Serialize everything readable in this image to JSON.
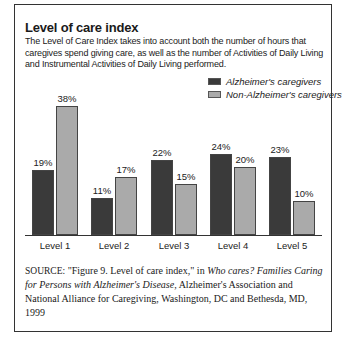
{
  "figure": {
    "title": "Level of care index",
    "subtitle": "The Level of Care Index takes into account both the number of hours that caregives spend giving care, as well as the number of Activities of Daily Living and Instrumental Activities of Daily Living performed.",
    "source_label": "SOURCE:",
    "source_part1": " \"Figure 9. Level of care index,\" in ",
    "source_italic": "Who cares? Families Caring for Persons with Alzheimer's Disease,",
    "source_part2": " Alzheimer's Association and National Alliance for Caregiving, Washington, DC and Bethesda, MD, 1999"
  },
  "colors": {
    "alzheimers": "#3a3a3a",
    "non_alzheimers": "#aaaaaa"
  },
  "chart_data": {
    "type": "bar",
    "title": "Level of care index",
    "categories": [
      "Level 1",
      "Level 2",
      "Level 3",
      "Level 4",
      "Level 5"
    ],
    "series": [
      {
        "name": "Alzheimer's caregivers",
        "values": [
          19,
          11,
          22,
          24,
          23
        ],
        "labels": [
          "19%",
          "11%",
          "22%",
          "24%",
          "23%"
        ]
      },
      {
        "name": "Non-Alzheimer's caregivers",
        "values": [
          38,
          17,
          15,
          20,
          10
        ],
        "labels": [
          "38%",
          "17%",
          "15%",
          "20%",
          "10%"
        ]
      }
    ],
    "xlabel": "",
    "ylabel": "",
    "ylim": [
      0,
      40
    ],
    "unit": "%",
    "grid": false,
    "legend_position": "top-right"
  }
}
